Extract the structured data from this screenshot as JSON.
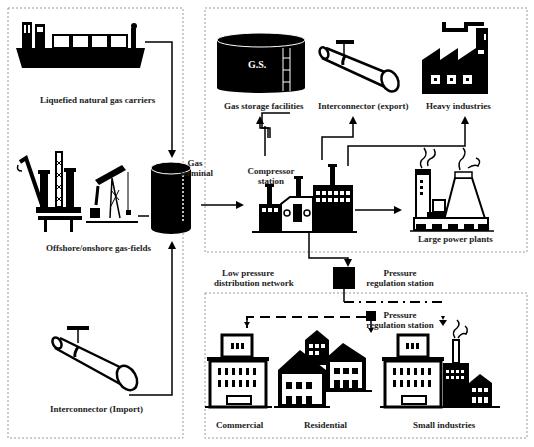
{
  "diagram": {
    "type": "natural-gas-supply-chain",
    "colors": {
      "ink": "#000000",
      "dash_border": "#9a9a9a",
      "background": "#ffffff"
    },
    "sources": {
      "lng_carriers": {
        "label": "Liquefied natural gas carriers",
        "icon": "lng-ship-icon"
      },
      "gas_fields": {
        "label": "Offshore/onshore gas-fields",
        "icon": "oil-rig-pumpjack-icon"
      },
      "interconnector_import": {
        "label": "Interconnector  (Import)",
        "icon": "pipeline-icon"
      }
    },
    "gas_terminal": {
      "label_line1": "Gas",
      "label_line2": "terminal",
      "icon": "storage-tank-icon"
    },
    "transmission": {
      "compressor_station": {
        "label_line1": "Compressor",
        "label_line2": "station",
        "icon": "compressor-icon"
      },
      "gas_storage": {
        "label": "Gas storage facilities",
        "tank_text": "G.S.",
        "icon": "gas-storage-tank-icon"
      },
      "interconnector_export": {
        "label": "Interconnector  (export)",
        "icon": "pipeline-icon"
      },
      "heavy_industries": {
        "label": "Heavy industries",
        "icon": "factory-icon"
      },
      "large_power_plants": {
        "label": "Large power plants",
        "icon": "power-plant-icon"
      }
    },
    "pressure_regulation_1": {
      "label_line1": "Pressure",
      "label_line2": "regulation station"
    },
    "low_pressure_network": {
      "label_line1": "Low pressure",
      "label_line2": "distribution network"
    },
    "distribution": {
      "pressure_regulation_2": {
        "label_line1": "Pressure",
        "label_line2": "regulation station"
      },
      "commercial": {
        "label": "Commercial",
        "icon": "office-building-icon"
      },
      "residential": {
        "label": "Residential",
        "icon": "houses-icon"
      },
      "small_industries": {
        "label": "Small industries",
        "icon": "small-factory-icon"
      }
    }
  }
}
